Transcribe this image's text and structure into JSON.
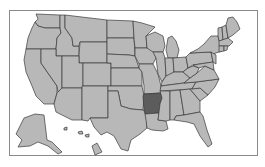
{
  "map": {
    "title": "",
    "region": "United States",
    "colors": {
      "default_fill": "#b8b8b8",
      "highlight_fill": "#5c5c5c",
      "border": "#3a3a3a",
      "frame": "#8a8a8a",
      "background": "#ffffff"
    },
    "highlighted_states": [
      "Arkansas"
    ],
    "states": [
      {
        "id": "WA",
        "name": "Washington",
        "points": "36,14 60,15 60,28 45,28 38,26 35,22 38,19"
      },
      {
        "id": "OR",
        "name": "Oregon",
        "points": "35,22 38,26 45,28 60,28 61,33 57,38 56,49 26,49 28,38 32,28"
      },
      {
        "id": "CA",
        "name": "California",
        "points": "26,49 41,49 41,63 57,86 57,93 54,104 44,104 36,96 32,86 26,72 24,60"
      },
      {
        "id": "ID",
        "name": "Idaho",
        "points": "60,15 65,15 65,28 72,38 73,46 79,46 79,56 56,56 56,49 57,38 61,33 60,28"
      },
      {
        "id": "NV",
        "name": "Nevada",
        "points": "41,49 56,49 56,56 62,56 62,88 58,92 57,86 41,63"
      },
      {
        "id": "MT",
        "name": "Montana",
        "points": "65,15 107,20 107,42 80,42 79,46 73,46 72,38 65,28"
      },
      {
        "id": "WY",
        "name": "Wyoming",
        "points": "80,42 107,42 107,63 79,63 79,56"
      },
      {
        "id": "UT",
        "name": "Utah",
        "points": "62,56 79,56 79,63 83,63 83,88 62,88"
      },
      {
        "id": "AZ",
        "name": "Arizona",
        "points": "62,88 82,88 82,120 72,120 56,112 54,104 57,93 58,92"
      },
      {
        "id": "CO",
        "name": "Colorado",
        "points": "83,63 111,63 111,86 83,86"
      },
      {
        "id": "NM",
        "name": "New Mexico",
        "points": "82,86 108,86 108,118 90,118 88,121 82,120"
      },
      {
        "id": "ND",
        "name": "North Dakota",
        "points": "107,20 133,21 134,38 107,38"
      },
      {
        "id": "SD",
        "name": "South Dakota",
        "points": "107,38 134,38 135,56 129,55 107,54"
      },
      {
        "id": "NE",
        "name": "Nebraska",
        "points": "107,54 129,55 135,56 139,68 111,68 111,63 107,63"
      },
      {
        "id": "KS",
        "name": "Kansas",
        "points": "111,68 139,68 142,72 142,86 111,86"
      },
      {
        "id": "OK",
        "name": "Oklahoma",
        "points": "108,86 142,86 144,96 143,110 131,109 121,106 118,91 108,91"
      },
      {
        "id": "TX",
        "name": "Texas",
        "points": "108,91 118,91 121,106 131,109 143,110 146,113 147,128 140,134 131,140 128,151 121,149 114,136 107,132 101,135 94,127 90,118 108,118"
      },
      {
        "id": "MN",
        "name": "Minnesota",
        "points": "133,21 142,23 155,27 146,36 147,48 135,48 134,38"
      },
      {
        "id": "IA",
        "name": "Iowa",
        "points": "135,48 153,48 156,58 153,64 139,64 135,56"
      },
      {
        "id": "MO",
        "name": "Missouri",
        "points": "139,64 153,64 158,74 161,86 161,93 144,94 144,86 142,72 139,68"
      },
      {
        "id": "AR",
        "name": "Arkansas",
        "points": "144,94 161,93 162,98 160,104 159,113 145,114 144,110 143,96",
        "highlight": true
      },
      {
        "id": "LA",
        "name": "Louisiana",
        "points": "145,114 159,113 158,120 166,121 168,129 163,131 152,130 147,128 146,120"
      },
      {
        "id": "WI",
        "name": "Wisconsin",
        "points": "146,36 155,32 163,36 165,46 163,52 153,52 147,48"
      },
      {
        "id": "IL",
        "name": "Illinois",
        "points": "153,52 163,52 165,58 166,76 162,82 158,74 156,58"
      },
      {
        "id": "MI",
        "name": "Michigan",
        "points": "168,38 172,36 176,41 179,50 177,58 168,58 166,50"
      },
      {
        "id": "IN",
        "name": "Indiana",
        "points": "165,58 173,58 174,72 168,76 166,76"
      },
      {
        "id": "OH",
        "name": "Ohio",
        "points": "173,58 186,57 188,68 183,72 174,72"
      },
      {
        "id": "KY",
        "name": "Kentucky",
        "points": "162,82 166,76 174,72 183,72 190,78 184,83 161,86"
      },
      {
        "id": "TN",
        "name": "Tennessee",
        "points": "161,86 184,83 196,82 192,89 160,91"
      },
      {
        "id": "MS",
        "name": "Mississippi",
        "points": "160,91 170,91 170,120 166,121 158,120 160,104 162,98"
      },
      {
        "id": "AL",
        "name": "Alabama",
        "points": "170,91 180,90 184,115 176,116 174,120 170,120"
      },
      {
        "id": "GA",
        "name": "Georgia",
        "points": "180,90 190,89 200,101 200,112 184,115"
      },
      {
        "id": "FL",
        "name": "Florida",
        "points": "174,120 176,116 184,115 200,112 203,116 207,130 212,144 208,147 200,136 194,124 187,122"
      },
      {
        "id": "SC",
        "name": "South Carolina",
        "points": "190,89 200,88 208,95 200,101"
      },
      {
        "id": "NC",
        "name": "North Carolina",
        "points": "192,89 196,82 219,79 215,87 208,95 200,88"
      },
      {
        "id": "VA",
        "name": "Virginia",
        "points": "190,78 197,73 205,66 214,70 219,79 196,82 184,83"
      },
      {
        "id": "WV",
        "name": "West Virginia",
        "points": "183,72 188,68 193,66 199,68 197,73 190,78"
      },
      {
        "id": "PA",
        "name": "Pennsylvania",
        "points": "186,57 190,53 211,52 213,62 193,65 188,68"
      },
      {
        "id": "NY",
        "name": "New York",
        "points": "190,53 198,49 204,44 211,36 218,36 222,51 213,54 211,52"
      },
      {
        "id": "MD",
        "name": "Maryland",
        "points": "193,65 213,62 214,70 205,66 199,68"
      },
      {
        "id": "NJ",
        "name": "New Jersey",
        "points": "211,52 216,55 216,64 213,62"
      },
      {
        "id": "VT",
        "name": "Vermont",
        "points": "218,28 222,27 223,40 219,41 218,36"
      },
      {
        "id": "NH",
        "name": "New Hampshire",
        "points": "222,27 226,25 228,38 223,40"
      },
      {
        "id": "MA",
        "name": "Massachusetts",
        "points": "219,41 228,38 233,42 229,46 219,46"
      },
      {
        "id": "CT",
        "name": "Connecticut",
        "points": "219,46 224,46 224,51 219,52"
      },
      {
        "id": "RI",
        "name": "Rhode Island",
        "points": "224,46 228,46 227,50 224,51"
      },
      {
        "id": "ME",
        "name": "Maine",
        "points": "226,25 228,18 233,17 237,22 240,29 233,35 228,38"
      },
      {
        "id": "AK",
        "name": "Alaska",
        "points": "24,118 35,114 44,115 47,140 52,142 62,152 58,154 48,146 38,142 30,146 18,147 22,140 16,134 20,126"
      },
      {
        "id": "HI1",
        "name": "Hawaii",
        "points": "92,146 97,143 102,152 95,155"
      },
      {
        "id": "HI2",
        "name": "Hawaii",
        "points": "64,128 67,127 67,130 64,130"
      },
      {
        "id": "HI3",
        "name": "Hawaii",
        "points": "78,132 82,131 83,134 79,134"
      },
      {
        "id": "HI4",
        "name": "Hawaii",
        "points": "85,135 89,134 89,137 86,137"
      }
    ]
  }
}
